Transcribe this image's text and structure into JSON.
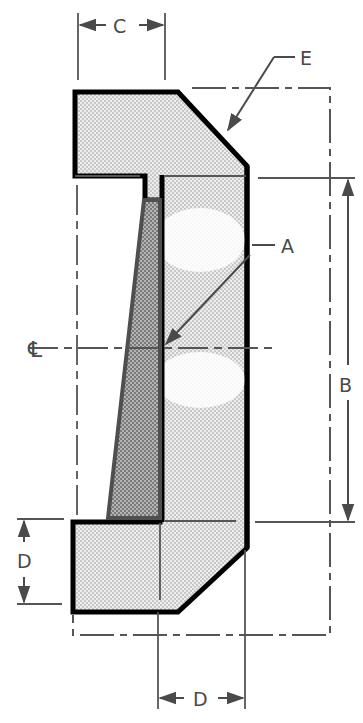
{
  "diagram": {
    "type": "engineering cross-section drawing",
    "labels": {
      "A": "A",
      "B": "B",
      "C": "C",
      "D_left": "D",
      "D_bottom": "D",
      "E": "E",
      "centerline": "℄"
    },
    "colors": {
      "outline": "#000000",
      "dimension": "#4a4a4a",
      "fill_light": "#e4e4e4",
      "fill_dark": "#6e6e6e",
      "background": "#ffffff"
    },
    "callouts": [
      {
        "label": "A",
        "target": "inner face at centerline"
      },
      {
        "label": "E",
        "target": "upper chamfered outer edge"
      }
    ],
    "dimensions": [
      {
        "label": "B",
        "orientation": "vertical",
        "position": "right"
      },
      {
        "label": "C",
        "orientation": "horizontal",
        "position": "top"
      },
      {
        "label": "D",
        "orientation": "vertical",
        "position": "lower-left"
      },
      {
        "label": "D",
        "orientation": "horizontal",
        "position": "bottom"
      }
    ]
  }
}
